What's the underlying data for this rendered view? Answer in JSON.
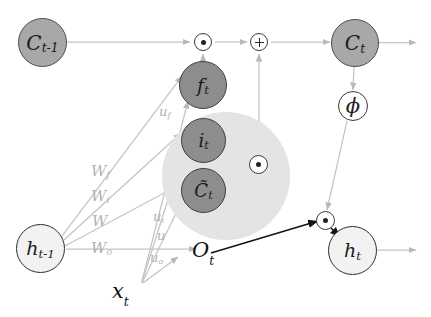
{
  "diagram": {
    "type": "neural-network-cell-diagram",
    "colors": {
      "cell_state_node": "#a8a8a8",
      "gate_node": "#8d8d8d",
      "hidden_node": "#f2f2f2",
      "operator_node": "#ffffff",
      "halo": "#e4e4e4",
      "weight_label": "#b2b2b2",
      "light_edge": "#c4c4c4",
      "dark_edge": "#1a1a1a"
    }
  },
  "nodes": {
    "c_prev": {
      "label": "C",
      "sub": "t-1",
      "name": "previous-cell-state"
    },
    "c_curr": {
      "label": "C",
      "sub": "t",
      "name": "current-cell-state"
    },
    "forget_gate": {
      "label": "f",
      "sub": "t",
      "name": "forget-gate"
    },
    "input_gate": {
      "label": "i",
      "sub": "t",
      "name": "input-gate"
    },
    "candidate": {
      "label": "C̃",
      "sub": "t",
      "name": "candidate-cell-state"
    },
    "output_gate": {
      "label": "O",
      "sub": "t",
      "name": "output-gate"
    },
    "h_prev": {
      "label": "h",
      "sub": "t-1",
      "name": "previous-hidden-state"
    },
    "h_curr": {
      "label": "h",
      "sub": "t",
      "name": "current-hidden-state"
    },
    "input_x": {
      "label": "x",
      "sub": "t",
      "name": "input-vector"
    },
    "phi": {
      "label": "ϕ",
      "name": "tanh-activation"
    }
  },
  "operators": {
    "forget_multiply": {
      "symbol": "⊙",
      "name": "forget-multiply-op"
    },
    "state_add": {
      "symbol": "+",
      "name": "state-add-op"
    },
    "input_multiply": {
      "symbol": "⊙",
      "name": "input-multiply-op"
    },
    "output_multiply": {
      "symbol": "⊙",
      "name": "output-multiply-op"
    }
  },
  "weights": {
    "w_f": {
      "label": "W",
      "sub": "f"
    },
    "w_i": {
      "label": "W",
      "sub": "i"
    },
    "w_c": {
      "label": "W",
      "sub": ""
    },
    "w_o": {
      "label": "W",
      "sub": "o"
    },
    "u_f": {
      "label": "u",
      "sub": "f"
    },
    "u_i": {
      "label": "u",
      "sub": "i"
    },
    "u_c": {
      "label": "u",
      "sub": ""
    },
    "u_o": {
      "label": "u",
      "sub": "o"
    }
  }
}
